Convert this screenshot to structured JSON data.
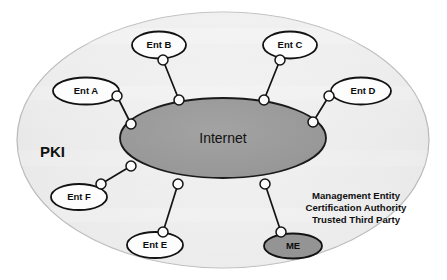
{
  "diagram": {
    "outer_region_label": "PKI",
    "center_label": "Internet",
    "colors": {
      "outer_fill": "#ececed",
      "outer_stroke": "#b9b9b9",
      "center_fill": "#9a9a9a",
      "center_stroke": "#1a1a1a",
      "entity_fill": "#fdfdfd",
      "entity_stroke": "#121212",
      "me_fill": "#949494",
      "link_stroke": "#141414",
      "node_fill": "#fbfbfb",
      "text": "#111111",
      "background": "#ffffff"
    },
    "entities": [
      {
        "id": "ent-a",
        "label": "Ent A"
      },
      {
        "id": "ent-b",
        "label": "Ent B"
      },
      {
        "id": "ent-c",
        "label": "Ent C"
      },
      {
        "id": "ent-d",
        "label": "Ent D"
      },
      {
        "id": "ent-e",
        "label": "Ent E"
      },
      {
        "id": "ent-f",
        "label": "Ent F"
      },
      {
        "id": "me",
        "label": "ME"
      }
    ],
    "management_entity_note": {
      "line1": "Management Entity",
      "line2": "Certification Authority",
      "line3": "Trusted Third Party"
    }
  }
}
